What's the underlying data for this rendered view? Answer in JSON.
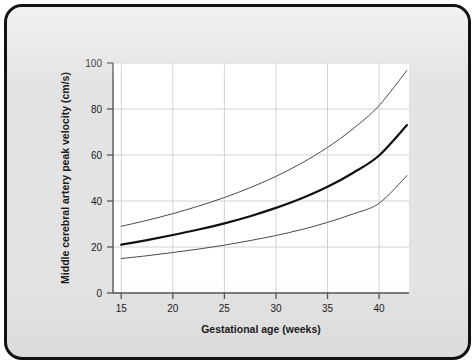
{
  "figure": {
    "background_color": "#e3e3e3",
    "border_color": "#121212",
    "plot_background_color": "#ffffff"
  },
  "chart_data": {
    "type": "line",
    "title": "",
    "subtitle": "",
    "xlabel": "Gestational age (weeks)",
    "ylabel": "Middle cerebral artery peak velocity (cm/s)",
    "xlim": [
      14.2,
      42.9
    ],
    "ylim": [
      0,
      100
    ],
    "xticks": [
      15,
      20,
      25,
      30,
      35,
      40
    ],
    "xticklabels": [
      "15",
      "20",
      "25",
      "30",
      "35",
      "40"
    ],
    "yticks": [
      0,
      20,
      40,
      60,
      80,
      100
    ],
    "yticklabels": [
      "0",
      "20",
      "40",
      "60",
      "80",
      "100"
    ],
    "grid": true,
    "grid_color": "#d2d2d2",
    "legend": "none",
    "annotations": [],
    "x": [
      15,
      17.5,
      20,
      22.5,
      25,
      27.5,
      30,
      32.5,
      35,
      37.5,
      40,
      42.7
    ],
    "series": [
      {
        "name": "Upper reference limit",
        "style": "thin",
        "color": "#4a4a4a",
        "width": 1.0,
        "values": [
          29.0,
          31.6,
          34.5,
          37.8,
          41.5,
          45.8,
          50.7,
          56.5,
          63.3,
          71.5,
          81.5,
          96.8
        ]
      },
      {
        "name": "Median",
        "style": "thick",
        "color": "#111111",
        "width": 2.2,
        "values": [
          21.0,
          23.0,
          25.2,
          27.6,
          30.3,
          33.4,
          37.0,
          41.2,
          46.2,
          52.3,
          59.8,
          73.0
        ]
      },
      {
        "name": "Lower reference limit",
        "style": "thin",
        "color": "#4a4a4a",
        "width": 1.0,
        "values": [
          15.0,
          16.2,
          17.6,
          19.1,
          20.8,
          22.8,
          25.0,
          27.6,
          30.7,
          34.4,
          39.0,
          51.0
        ]
      }
    ]
  }
}
